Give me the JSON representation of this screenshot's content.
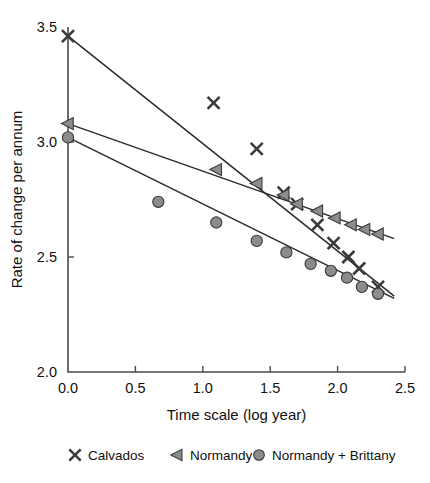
{
  "chart_data": {
    "type": "scatter",
    "title": "",
    "xlabel": "Time scale (log year)",
    "ylabel": "Rate of change per annum",
    "xlim": [
      0.0,
      2.5
    ],
    "ylim": [
      2.0,
      3.5
    ],
    "xticks": [
      "0.0",
      "0.5",
      "1.0",
      "1.5",
      "2.0",
      "2.5"
    ],
    "xtick_values": [
      0.0,
      0.5,
      1.0,
      1.5,
      2.0,
      2.5
    ],
    "yticks": [
      "2.0",
      "2.5",
      "3.0",
      "3.5"
    ],
    "ytick_values": [
      2.0,
      2.5,
      3.0,
      3.5
    ],
    "grid": false,
    "legend_position": "bottom",
    "series": [
      {
        "name": "Calvados",
        "marker": "x",
        "color": "#3a3a3a",
        "points": [
          {
            "x": 0.0,
            "y": 3.46
          },
          {
            "x": 1.08,
            "y": 3.17
          },
          {
            "x": 1.4,
            "y": 2.97
          },
          {
            "x": 1.6,
            "y": 2.78
          },
          {
            "x": 1.7,
            "y": 2.73
          },
          {
            "x": 1.85,
            "y": 2.64
          },
          {
            "x": 1.97,
            "y": 2.56
          },
          {
            "x": 2.08,
            "y": 2.5
          },
          {
            "x": 2.16,
            "y": 2.45
          },
          {
            "x": 2.3,
            "y": 2.37
          }
        ],
        "fit_line": {
          "x0": 0.0,
          "y0": 3.46,
          "x1": 2.42,
          "y1": 2.33
        }
      },
      {
        "name": "Normandy",
        "marker": "triangle-left",
        "color": "#8c8c8c",
        "points": [
          {
            "x": 0.0,
            "y": 3.08
          },
          {
            "x": 1.1,
            "y": 2.88
          },
          {
            "x": 1.4,
            "y": 2.82
          },
          {
            "x": 1.6,
            "y": 2.77
          },
          {
            "x": 1.7,
            "y": 2.73
          },
          {
            "x": 1.85,
            "y": 2.7
          },
          {
            "x": 1.98,
            "y": 2.67
          },
          {
            "x": 2.1,
            "y": 2.64
          },
          {
            "x": 2.2,
            "y": 2.62
          },
          {
            "x": 2.3,
            "y": 2.6
          }
        ],
        "fit_line": {
          "x0": 0.0,
          "y0": 3.08,
          "x1": 2.42,
          "y1": 2.58
        }
      },
      {
        "name": "Normandy + Brittany",
        "marker": "circle",
        "color": "#8c8c8c",
        "points": [
          {
            "x": 0.0,
            "y": 3.02
          },
          {
            "x": 0.67,
            "y": 2.74
          },
          {
            "x": 1.1,
            "y": 2.65
          },
          {
            "x": 1.4,
            "y": 2.57
          },
          {
            "x": 1.62,
            "y": 2.52
          },
          {
            "x": 1.8,
            "y": 2.47
          },
          {
            "x": 1.95,
            "y": 2.44
          },
          {
            "x": 2.07,
            "y": 2.41
          },
          {
            "x": 2.18,
            "y": 2.37
          },
          {
            "x": 2.3,
            "y": 2.34
          }
        ],
        "fit_line": {
          "x0": 0.0,
          "y0": 3.02,
          "x1": 2.42,
          "y1": 2.32
        }
      }
    ]
  },
  "legend": {
    "items": [
      {
        "label": "Calvados",
        "marker": "x-marker-icon"
      },
      {
        "label": "Normandy",
        "marker": "triangle-left-marker-icon"
      },
      {
        "label": "Normandy + Brittany",
        "marker": "circle-marker-icon"
      }
    ]
  },
  "axes": {
    "x_title": "Time scale (log year)",
    "y_title": "Rate of change per annum"
  }
}
